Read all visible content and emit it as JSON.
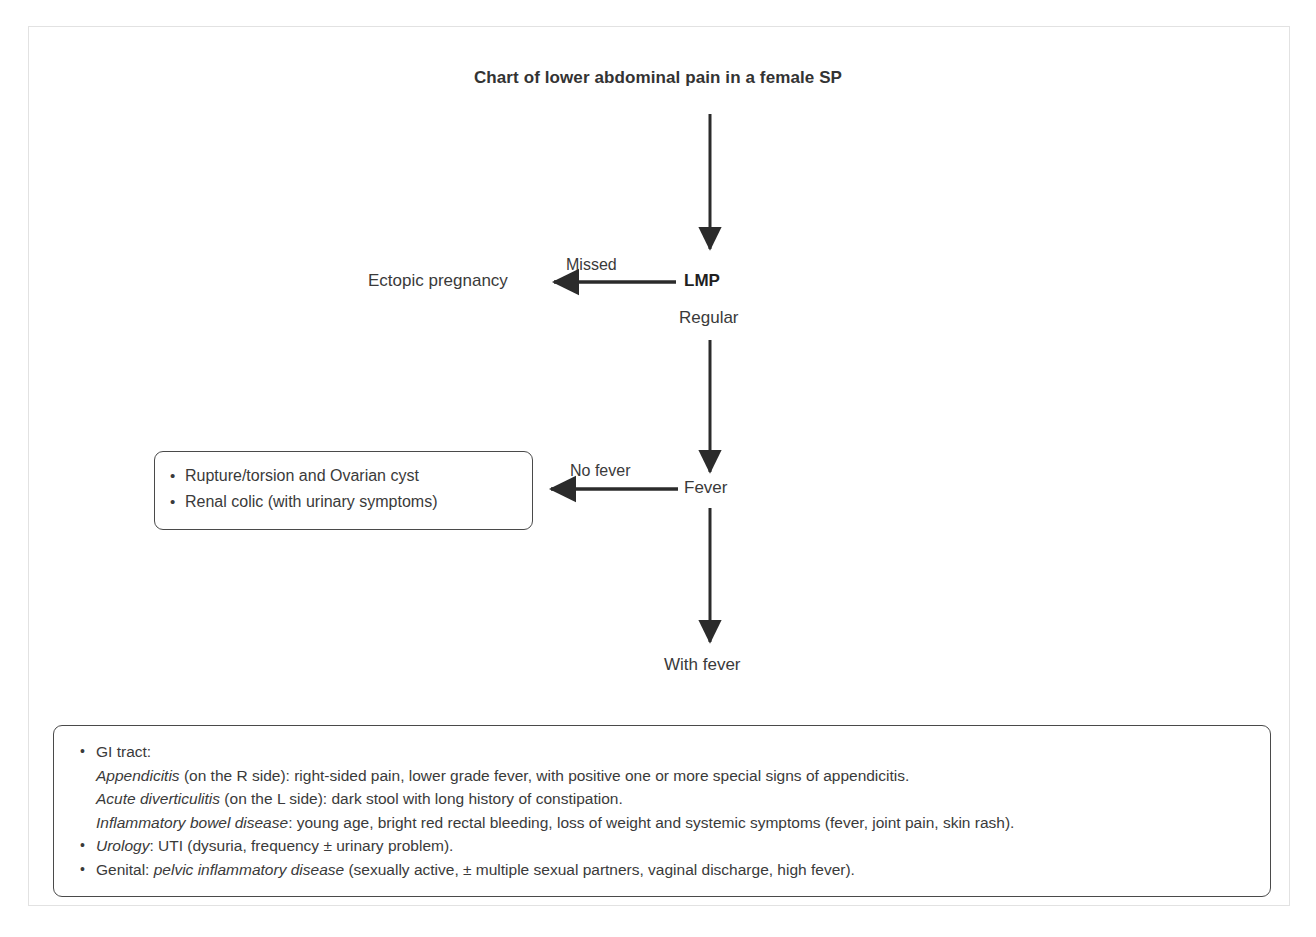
{
  "title": "Chart of lower abdominal pain in a female SP",
  "flow": {
    "nodes": [
      {
        "id": "lmp",
        "label": "LMP",
        "emphasis": "bold"
      },
      {
        "id": "regular",
        "label": "Regular",
        "emphasis": "normal"
      },
      {
        "id": "ectopic",
        "label": "Ectopic pregnancy",
        "emphasis": "normal"
      },
      {
        "id": "fever",
        "label": "Fever",
        "emphasis": "normal"
      },
      {
        "id": "with-fever",
        "label": "With fever",
        "emphasis": "normal"
      }
    ],
    "edge_labels": [
      {
        "id": "missed",
        "label": "Missed"
      },
      {
        "id": "no-fever",
        "label": "No fever"
      }
    ]
  },
  "outcome_box": {
    "items": [
      "Rupture/torsion and Ovarian cyst",
      "Renal colic (with urinary symptoms)"
    ]
  },
  "detail_box": {
    "bullets": [
      {
        "heading": "GI tract:",
        "heading_italic": false,
        "lines": [
          {
            "italic": "Appendicitis",
            "rest": " (on the R side): right-sided pain, lower grade fever, with positive one or more special signs of appendicitis."
          },
          {
            "italic": "Acute diverticulitis",
            "rest": " (on the L side): dark stool with long history of constipation."
          },
          {
            "italic": "Inflammatory bowel disease",
            "rest": ": young age, bright red rectal bleeding, loss of weight and systemic symptoms (fever, joint pain, skin rash)."
          }
        ]
      },
      {
        "heading_italic": true,
        "heading": "Urology",
        "heading_rest": ": UTI (dysuria, frequency ± urinary problem).",
        "lines": []
      },
      {
        "heading_italic": false,
        "heading": "Genital: ",
        "inline_italic": "pelvic inflammatory disease",
        "heading_rest": " (sexually active, ± multiple sexual partners, vaginal discharge, high fever).",
        "lines": []
      }
    ]
  },
  "colors": {
    "arrow": "#2b2b2b",
    "text": "#3a3a3a",
    "box_border": "#4a4a4a",
    "outer_frame": "#e2e2e2"
  }
}
